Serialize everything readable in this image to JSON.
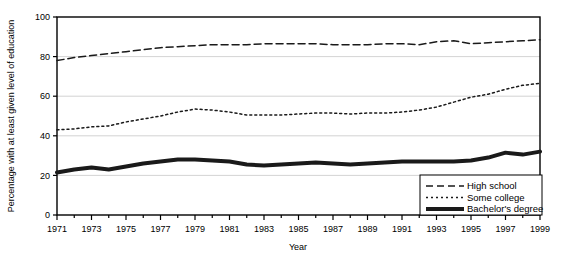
{
  "chart_data": {
    "type": "line",
    "title": "",
    "xlabel": "Year",
    "ylabel": "Percentage with at least given level of education",
    "xlim": [
      1971,
      1999
    ],
    "ylim": [
      0,
      100
    ],
    "grid": true,
    "legend_position": "bottom-right",
    "x": [
      1971,
      1972,
      1973,
      1974,
      1975,
      1976,
      1977,
      1978,
      1979,
      1980,
      1981,
      1982,
      1983,
      1984,
      1985,
      1986,
      1987,
      1988,
      1989,
      1990,
      1991,
      1992,
      1993,
      1994,
      1995,
      1996,
      1997,
      1998,
      1999
    ],
    "xticks": [
      1971,
      1973,
      1975,
      1977,
      1979,
      1981,
      1983,
      1985,
      1987,
      1989,
      1991,
      1993,
      1995,
      1997,
      1999
    ],
    "xtick_labels": [
      "1971",
      "1973",
      "1975",
      "1977",
      "1979",
      "1981",
      "1983",
      "1985",
      "1987",
      "1989",
      "1991",
      "1993",
      "1995",
      "1997",
      "1999"
    ],
    "yticks": [
      0,
      20,
      40,
      60,
      80,
      100
    ],
    "ytick_labels": [
      "0",
      "20",
      "40",
      "60",
      "80",
      "100"
    ],
    "series": [
      {
        "name": "High school",
        "style": "dashed",
        "color": "#1a1a1a",
        "values": [
          78.0,
          79.5,
          80.5,
          81.5,
          82.5,
          83.5,
          84.5,
          85.0,
          85.5,
          86.0,
          86.0,
          86.0,
          86.5,
          86.5,
          86.5,
          86.5,
          86.0,
          86.0,
          86.0,
          86.5,
          86.5,
          86.0,
          87.5,
          88.0,
          86.5,
          87.0,
          87.5,
          88.0,
          88.5
        ]
      },
      {
        "name": "Some college",
        "style": "dotted",
        "color": "#1a1a1a",
        "values": [
          43.0,
          43.5,
          44.5,
          45.0,
          47.0,
          48.5,
          50.0,
          52.0,
          53.5,
          53.0,
          52.0,
          50.5,
          50.5,
          50.5,
          51.0,
          51.5,
          51.5,
          51.0,
          51.5,
          51.5,
          52.0,
          53.0,
          54.5,
          57.0,
          59.5,
          61.0,
          63.5,
          65.5,
          66.5
        ]
      },
      {
        "name": "Bachelor's degree",
        "style": "solid-thick",
        "color": "#1a1a1a",
        "values": [
          21.5,
          23.0,
          24.0,
          23.0,
          24.5,
          26.0,
          27.0,
          28.0,
          28.0,
          27.5,
          27.0,
          25.5,
          25.0,
          25.5,
          26.0,
          26.5,
          26.0,
          25.5,
          26.0,
          26.5,
          27.0,
          27.0,
          27.0,
          27.0,
          27.5,
          29.0,
          31.5,
          30.5,
          32.0
        ]
      }
    ]
  },
  "legend": {
    "items": [
      {
        "label": "High school",
        "style": "dashed"
      },
      {
        "label": "Some college",
        "style": "dotted"
      },
      {
        "label": "Bachelor's degree",
        "style": "solid-thick"
      }
    ]
  }
}
